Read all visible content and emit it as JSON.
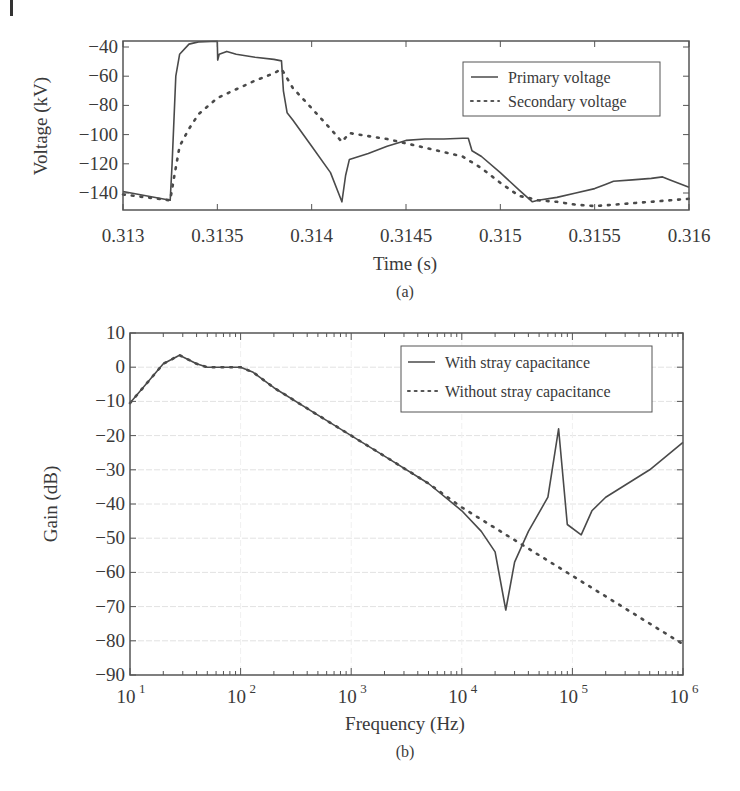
{
  "figure": {
    "panels": [
      {
        "caption": "(a)",
        "title": "",
        "xlabel": "Time (s)",
        "ylabel": "Voltage (kV)",
        "legend": [
          "Primary voltage",
          "Secondary voltage"
        ]
      },
      {
        "caption": "(b)",
        "title": "",
        "xlabel": "Frequency (Hz)",
        "ylabel": "Gain (dB)",
        "legend": [
          "With stray capacitance",
          "Without stray capacitance"
        ]
      }
    ]
  },
  "chart_data": [
    {
      "type": "line",
      "title": "",
      "caption": "(a)",
      "xlabel": "Time (s)",
      "ylabel": "Voltage (kV)",
      "xlim": [
        0.313,
        0.316
      ],
      "ylim": [
        -151,
        -36
      ],
      "xticks": [
        0.313,
        0.3135,
        0.314,
        0.3145,
        0.315,
        0.3155,
        0.316
      ],
      "xtick_labels": [
        "0.313",
        "0.3135",
        "0.314",
        "0.3145",
        "0.315",
        "0.3155",
        "0.316"
      ],
      "yticks": [
        -40,
        -60,
        -80,
        -100,
        -120,
        -140
      ],
      "ytick_labels": [
        "−40",
        "−60",
        "−80",
        "−100",
        "−120",
        "−140"
      ],
      "grid": false,
      "legend_position": "upper right",
      "series": [
        {
          "name": "Primary voltage",
          "style": "solid",
          "x": [
            0.313,
            0.31325,
            0.31326,
            0.31328,
            0.3133,
            0.31335,
            0.3134,
            0.3135,
            0.313502,
            0.31351,
            0.31355,
            0.3136,
            0.3137,
            0.3138,
            0.31384,
            0.31385,
            0.31387,
            0.3139,
            0.314,
            0.3141,
            0.31416,
            0.31418,
            0.3142,
            0.3143,
            0.3144,
            0.3145,
            0.3146,
            0.3147,
            0.3148,
            0.31483,
            0.31485,
            0.3149,
            0.315,
            0.3151,
            0.31517,
            0.3152,
            0.3153,
            0.3154,
            0.3155,
            0.31556,
            0.3156,
            0.3157,
            0.3158,
            0.31586,
            0.3159,
            0.316
          ],
          "values": [
            -139,
            -145,
            -120,
            -60,
            -45,
            -38,
            -36.5,
            -36,
            -49,
            -45,
            -43,
            -45,
            -47,
            -48.5,
            -49.5,
            -70,
            -85,
            -90,
            -108,
            -126,
            -146,
            -128,
            -117,
            -113,
            -108,
            -104,
            -103,
            -103,
            -102.5,
            -102.5,
            -111,
            -115,
            -126,
            -138,
            -146,
            -145,
            -143,
            -140,
            -137,
            -134,
            -132,
            -131,
            -130,
            -129,
            -131,
            -136
          ]
        },
        {
          "name": "Secondary voltage",
          "style": "dotted",
          "x": [
            0.313,
            0.31325,
            0.31327,
            0.3133,
            0.31335,
            0.3134,
            0.3135,
            0.3136,
            0.3137,
            0.3138,
            0.31384,
            0.3139,
            0.314,
            0.3141,
            0.31416,
            0.3142,
            0.3143,
            0.3144,
            0.3145,
            0.3146,
            0.3147,
            0.3148,
            0.3149,
            0.315,
            0.3151,
            0.31517,
            0.3152,
            0.3153,
            0.3154,
            0.3155,
            0.3156,
            0.3157,
            0.3158,
            0.3159,
            0.316
          ],
          "values": [
            -141,
            -145,
            -130,
            -108,
            -96,
            -86,
            -75,
            -69,
            -63,
            -58,
            -55,
            -68,
            -82,
            -96,
            -105,
            -99,
            -101,
            -103,
            -106,
            -109,
            -112,
            -115,
            -123,
            -133,
            -142,
            -144,
            -145,
            -146,
            -148,
            -149,
            -148,
            -147,
            -146,
            -145,
            -144
          ]
        }
      ]
    },
    {
      "type": "line",
      "title": "",
      "caption": "(b)",
      "xlabel": "Frequency (Hz)",
      "ylabel": "Gain (dB)",
      "xscale": "log",
      "xlim": [
        10,
        1000000
      ],
      "ylim": [
        -90,
        10
      ],
      "xticks": [
        10,
        100,
        1000,
        10000,
        100000,
        1000000
      ],
      "xtick_labels": [
        "10^1",
        "10^2",
        "10^3",
        "10^4",
        "10^5",
        "10^6"
      ],
      "yticks": [
        10,
        0,
        -10,
        -20,
        -30,
        -40,
        -50,
        -60,
        -70,
        -80,
        -90
      ],
      "ytick_labels": [
        "10",
        "0",
        "−10",
        "−20",
        "−30",
        "−40",
        "−50",
        "−60",
        "−70",
        "−80",
        "−90"
      ],
      "grid": true,
      "legend_position": "upper right",
      "series": [
        {
          "name": "With stray capacitance",
          "style": "solid",
          "x": [
            10,
            20,
            28,
            40,
            50,
            70,
            100,
            130,
            200,
            500,
            1000,
            2000,
            5000,
            10000,
            15000,
            20000,
            25000,
            30000,
            40000,
            60000,
            75000,
            90000,
            120000,
            150000,
            200000,
            500000,
            1000000
          ],
          "values": [
            -10.5,
            1,
            3.5,
            1,
            0,
            0,
            0,
            -1.5,
            -6,
            -14,
            -20,
            -26,
            -34,
            -42,
            -48,
            -54,
            -71,
            -57,
            -48,
            -38,
            -18,
            -46,
            -49,
            -42,
            -38,
            -30,
            -22
          ]
        },
        {
          "name": "Without stray capacitance",
          "style": "dotted",
          "x": [
            10,
            20,
            28,
            40,
            50,
            70,
            100,
            130,
            200,
            500,
            1000,
            2000,
            5000,
            10000,
            100000,
            1000000
          ],
          "values": [
            -10.5,
            1,
            3.5,
            1,
            0,
            0,
            0,
            -1.5,
            -6,
            -14,
            -20,
            -26,
            -34,
            -41,
            -61,
            -81
          ]
        }
      ]
    }
  ]
}
